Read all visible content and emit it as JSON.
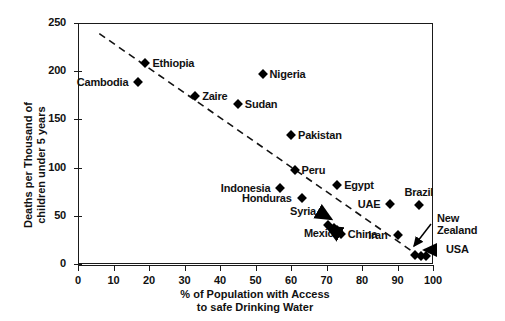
{
  "chart_data": {
    "type": "scatter",
    "title": "",
    "xlabel": "% of Population with Access to safe Drinking Water",
    "xlabel_line1": "% of Population with Access",
    "xlabel_line2": "to safe Drinking Water",
    "ylabel": "Deaths per Thousand of children under 5 years",
    "ylabel_line1": "Deaths per Thousand of",
    "ylabel_line2": "children under 5 years",
    "xlim": [
      0,
      100
    ],
    "ylim": [
      0,
      250
    ],
    "xticks": [
      "0",
      "10",
      "20",
      "30",
      "40",
      "50",
      "60",
      "70",
      "80",
      "90",
      "100"
    ],
    "yticks": [
      "0",
      "50",
      "100",
      "150",
      "200",
      "250"
    ],
    "grid": false,
    "legend": "none",
    "marker_style": "filled-diamond",
    "marker_color": "#000000",
    "trendline": {
      "style": "dashed",
      "description": "negative linear trend",
      "x_start": 6,
      "y_start": 239,
      "x_end": 95,
      "y_end": 11
    },
    "points": [
      {
        "name": "Cambodia",
        "x": 17,
        "y": 189,
        "label_side": "left"
      },
      {
        "name": "Ethiopia",
        "x": 19,
        "y": 208,
        "label_side": "right"
      },
      {
        "name": "Zaire",
        "x": 33,
        "y": 174,
        "label_side": "right"
      },
      {
        "name": "Sudan",
        "x": 45,
        "y": 166,
        "label_side": "right"
      },
      {
        "name": "Nigeria",
        "x": 52,
        "y": 197,
        "label_side": "right"
      },
      {
        "name": "Pakistan",
        "x": 60,
        "y": 134,
        "label_side": "right"
      },
      {
        "name": "Peru",
        "x": 61,
        "y": 98,
        "label_side": "right"
      },
      {
        "name": "Indonesia",
        "x": 57,
        "y": 79,
        "label_side": "left"
      },
      {
        "name": "Honduras",
        "x": 63,
        "y": 68,
        "label_side": "left"
      },
      {
        "name": "Egypt",
        "x": 73,
        "y": 82,
        "label_side": "right"
      },
      {
        "name": "UAE",
        "x": 88,
        "y": 62,
        "label_side": "left"
      },
      {
        "name": "Brazil",
        "x": 96,
        "y": 61,
        "label_side": "above"
      },
      {
        "name": "Syria",
        "x": 72,
        "y": 42,
        "label_side": "arrow-left"
      },
      {
        "name": "Mexico",
        "x": 71,
        "y": 33,
        "label_side": "arrow-left"
      },
      {
        "name": "China",
        "x": 74,
        "y": 31,
        "label_side": "right"
      },
      {
        "name": "Iran",
        "x": 90,
        "y": 30,
        "label_side": "left"
      },
      {
        "name": "New Zealand",
        "x": 96,
        "y": 9,
        "label_side": "arrow-right"
      },
      {
        "name": "USA",
        "x": 99,
        "y": 8,
        "label_side": "arrow-right"
      }
    ],
    "cluster_points": [
      {
        "x": 70.5,
        "y": 40
      },
      {
        "x": 72.0,
        "y": 37
      },
      {
        "x": 73.0,
        "y": 35
      },
      {
        "x": 95.0,
        "y": 9
      },
      {
        "x": 96.5,
        "y": 8
      },
      {
        "x": 98.0,
        "y": 8
      }
    ]
  },
  "labels": {
    "cambodia": "Cambodia",
    "ethiopia": "Ethiopia",
    "zaire": "Zaire",
    "sudan": "Sudan",
    "nigeria": "Nigeria",
    "pakistan": "Pakistan",
    "peru": "Peru",
    "indonesia": "Indonesia",
    "honduras": "Honduras",
    "egypt": "Egypt",
    "uae": "UAE",
    "brazil": "Brazil",
    "syria": "Syria",
    "mexico": "Mexico",
    "china": "China",
    "iran": "Iran",
    "new_zealand_l1": "New",
    "new_zealand_l2": "Zealand",
    "usa": "USA"
  }
}
